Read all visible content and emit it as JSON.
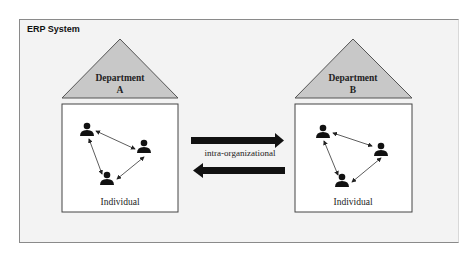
{
  "diagram": {
    "frame_title": "ERP System",
    "departments": [
      {
        "name": "Department",
        "letter": "A",
        "member_label": "Individual"
      },
      {
        "name": "Department",
        "letter": "B",
        "member_label": "Individual"
      }
    ],
    "connector_label": "intra-organizational",
    "colors": {
      "frame_bg": "#f3f3f3",
      "triangle_fill": "#c8c8c8",
      "box_fill": "#ffffff",
      "arrow": "#111111"
    }
  }
}
